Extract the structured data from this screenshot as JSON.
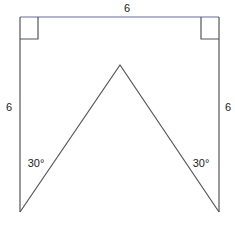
{
  "diagram": {
    "top_label": "6",
    "left_label": "6",
    "right_label": "6",
    "left_angle": "30°",
    "right_angle": "30°",
    "colors": {
      "stroke": "#555555",
      "top_edge": "#6a6aa0"
    }
  }
}
